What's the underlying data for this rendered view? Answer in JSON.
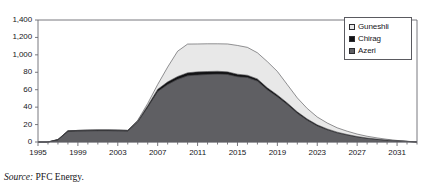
{
  "figure": {
    "top_crop_text": "",
    "source_prefix": "Source:",
    "source_value": "PFC Energy."
  },
  "legend": {
    "position": "top-right-inside",
    "items": [
      {
        "label": "Guneshli",
        "color": "#e8e8e8",
        "swatch_name": "legend-swatch-guneshli"
      },
      {
        "label": "Chirag",
        "color": "#121214",
        "swatch_name": "legend-swatch-chirag"
      },
      {
        "label": "Azeri",
        "color": "#5f5f63",
        "swatch_name": "legend-swatch-azeri"
      }
    ]
  },
  "chart_data": {
    "type": "area",
    "stacked": true,
    "title": "",
    "subtitle": "",
    "xlabel": "",
    "ylabel": "",
    "xlim": [
      1995,
      2033
    ],
    "ylim": [
      0,
      1400
    ],
    "grid": false,
    "y_ticks": [
      0,
      20,
      40,
      60,
      80,
      1000,
      1200,
      1400
    ],
    "y_tick_labels": [
      "0",
      "20",
      "40",
      "60",
      "80",
      "1,000",
      "1,200",
      "1,400"
    ],
    "x_ticks": [
      1995,
      1999,
      2003,
      2007,
      2011,
      2015,
      2019,
      2023,
      2027,
      2031
    ],
    "x_tick_labels": [
      "1995",
      "1999",
      "2003",
      "2007",
      "2011",
      "2015",
      "2019",
      "2023",
      "2027",
      "2031"
    ],
    "x_minor_tick_interval": 1,
    "x": [
      1995,
      1996,
      1997,
      1998,
      1999,
      2000,
      2001,
      2002,
      2003,
      2004,
      2005,
      2006,
      2007,
      2008,
      2009,
      2010,
      2011,
      2012,
      2013,
      2014,
      2015,
      2016,
      2017,
      2018,
      2019,
      2020,
      2021,
      2022,
      2023,
      2024,
      2025,
      2026,
      2027,
      2028,
      2029,
      2030,
      2031,
      2032,
      2033
    ],
    "series": [
      {
        "name": "Azeri",
        "color": "#5f5f63",
        "values": [
          0,
          0,
          25,
          120,
          125,
          128,
          130,
          130,
          128,
          125,
          230,
          400,
          580,
          660,
          720,
          760,
          770,
          775,
          780,
          775,
          750,
          740,
          700,
          600,
          520,
          430,
          330,
          250,
          185,
          140,
          105,
          80,
          58,
          42,
          30,
          20,
          12,
          6,
          0
        ]
      },
      {
        "name": "Chirag",
        "color": "#121214",
        "values": [
          0,
          0,
          3,
          8,
          8,
          8,
          8,
          8,
          8,
          8,
          12,
          18,
          25,
          30,
          32,
          34,
          35,
          34,
          32,
          30,
          28,
          26,
          24,
          22,
          20,
          18,
          16,
          14,
          12,
          10,
          8,
          6,
          5,
          4,
          3,
          2,
          1,
          1,
          0
        ]
      },
      {
        "name": "Guneshli",
        "color": "#e8e8e8",
        "values": [
          0,
          0,
          0,
          0,
          0,
          0,
          0,
          0,
          0,
          0,
          8,
          25,
          55,
          170,
          290,
          330,
          320,
          318,
          315,
          320,
          330,
          320,
          300,
          300,
          270,
          210,
          160,
          120,
          90,
          68,
          50,
          38,
          28,
          20,
          14,
          9,
          5,
          2,
          0
        ]
      }
    ],
    "totals": [
      0,
      0,
      28,
      128,
      133,
      136,
      138,
      138,
      136,
      133,
      250,
      443,
      660,
      860,
      1042,
      1124,
      1125,
      1127,
      1127,
      1125,
      1108,
      1086,
      1024,
      922,
      810,
      658,
      506,
      384,
      287,
      218,
      163,
      124,
      91,
      66,
      47,
      31,
      18,
      9,
      0
    ],
    "peak_total": 1127,
    "peak_year": 2012
  }
}
